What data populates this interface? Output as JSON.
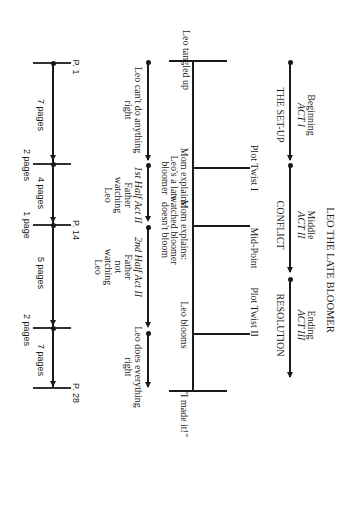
{
  "title": "LEO THE LATE BLOOMER",
  "acts": [
    {
      "position": "Beginning",
      "act": "ACT I",
      "name": "THE SET-UP"
    },
    {
      "position": "Middle",
      "act": "ACT II",
      "name": "CONFLICT"
    },
    {
      "position": "Ending",
      "act": "ACT III",
      "name": "RESOLUTION"
    }
  ],
  "plot_points": [
    {
      "label": "Plot Twist I"
    },
    {
      "label": "Mid-Point"
    },
    {
      "label": "Plot Twist II"
    }
  ],
  "spine_events": {
    "start": "Leo tangled up",
    "mom1": "Mom explains:\nLeo's a late\nbloomer",
    "mom2": "Mom explains:\nwatched bloomer\ndoesn't bloom",
    "blooms": "Leo blooms",
    "end": "\"I made it!\""
  },
  "story_segments": [
    {
      "text": "Leo can't do anything\nright"
    },
    {
      "heading": "1st Half Act II",
      "text": "Father\nwatching\nLeo"
    },
    {
      "heading": "2nd Half Act II",
      "text": "Father\nnot\nwatching\nLeo"
    },
    {
      "text": "Leo does everything\nright"
    }
  ],
  "page_markers": {
    "start": "P. 1",
    "mid": "P. 14",
    "end": "P. 28"
  },
  "page_spans": [
    {
      "label": "7 pages"
    },
    {
      "label": "2 pages"
    },
    {
      "label": "4 pages"
    },
    {
      "label": "1 page"
    },
    {
      "label": "5 pages"
    },
    {
      "label": "2 pages"
    },
    {
      "label": "7 pages"
    }
  ]
}
